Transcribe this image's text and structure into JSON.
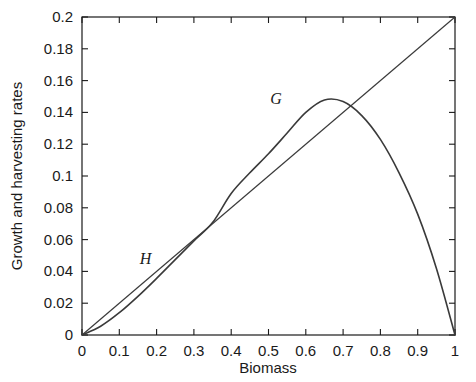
{
  "chart_data": {
    "type": "line",
    "title": "",
    "xlabel": "Biomass",
    "ylabel": "Growth and harvesting rates",
    "xlim": [
      0,
      1
    ],
    "ylim": [
      0,
      0.2
    ],
    "grid": false,
    "legend_position": "inline-annotations",
    "xticks": [
      "0",
      "0.1",
      "0.2",
      "0.3",
      "0.4",
      "0.5",
      "0.6",
      "0.7",
      "0.8",
      "0.9",
      "1"
    ],
    "xtick_values": [
      0,
      0.1,
      0.2,
      0.3,
      0.4,
      0.5,
      0.6,
      0.7,
      0.8,
      0.9,
      1
    ],
    "yticks": [
      "0",
      "0.02",
      "0.04",
      "0.06",
      "0.08",
      "0.1",
      "0.12",
      "0.14",
      "0.16",
      "0.18",
      "0.2"
    ],
    "ytick_values": [
      0,
      0.02,
      0.04,
      0.06,
      0.08,
      0.1,
      0.12,
      0.14,
      0.16,
      0.18,
      0.2
    ],
    "series": [
      {
        "name": "G",
        "label": "G",
        "description": "Growth rate curve (logistic), peak near x=0.66",
        "color": "#3a3a3a",
        "x": [
          0.0,
          0.05,
          0.1,
          0.15,
          0.2,
          0.25,
          0.3,
          0.35,
          0.4,
          0.45,
          0.5,
          0.55,
          0.6,
          0.65,
          0.7,
          0.75,
          0.8,
          0.85,
          0.9,
          0.95,
          1.0
        ],
        "values": [
          0.0,
          0.0055,
          0.014,
          0.0243,
          0.0356,
          0.0474,
          0.0592,
          0.0707,
          0.089,
          0.102,
          0.114,
          0.127,
          0.14,
          0.1478,
          0.1468,
          0.138,
          0.123,
          0.102,
          0.076,
          0.042,
          0.0
        ]
      },
      {
        "name": "H",
        "label": "H",
        "description": "Harvesting rate, straight line from (0,0) to (1,0.2)",
        "color": "#3a3a3a",
        "x": [
          0,
          1
        ],
        "values": [
          0,
          0.2
        ]
      }
    ],
    "annotations": [
      {
        "text": "G",
        "x": 0.505,
        "y": 0.1455
      },
      {
        "text": "H",
        "x": 0.155,
        "y": 0.0445
      }
    ],
    "intersections": [
      {
        "x": 0.275,
        "y": 0.055
      },
      {
        "x": 0.725,
        "y": 0.145
      }
    ]
  }
}
